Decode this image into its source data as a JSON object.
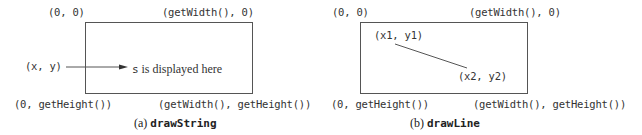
{
  "panels": [
    {
      "id": "a",
      "caption_label": "(a)",
      "caption_method": "drawString",
      "corners": {
        "top_left": "(0, 0)",
        "top_right": "(getWidth(), 0)",
        "bottom_left": "(0, getHeight())",
        "bottom_right": "(getWidth(), getHeight())"
      },
      "point_label": "(x, y)",
      "string_var": "s",
      "string_text": " is displayed here"
    },
    {
      "id": "b",
      "caption_label": "(b)",
      "caption_method": "drawLine",
      "corners": {
        "top_left": "(0, 0)",
        "top_right": "(getWidth(), 0)",
        "bottom_left": "(0, getHeight())",
        "bottom_right": "(getWidth(), getHeight())"
      },
      "point1_label": "(x1, y1)",
      "point2_label": "(x2, y2)"
    }
  ],
  "colors": {
    "line": "#555555",
    "text": "#333333"
  }
}
